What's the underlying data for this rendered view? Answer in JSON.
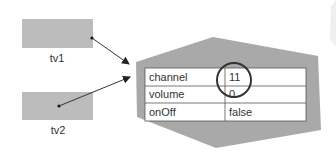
{
  "variables": [
    {
      "name": "tv1"
    },
    {
      "name": "tv2"
    }
  ],
  "object": {
    "fields": [
      {
        "key": "channel",
        "value": "11"
      },
      {
        "key": "volume",
        "value": "0"
      },
      {
        "key": "onOff",
        "value": "false"
      }
    ],
    "highlighted_field": "channel"
  },
  "colors": {
    "box": "#bcbcbc",
    "object_shape": "#a9a9a9",
    "table_bg": "#ffffff",
    "line": "#333333"
  }
}
